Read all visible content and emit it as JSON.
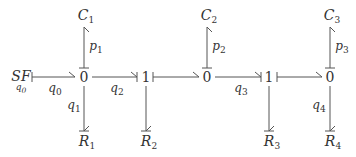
{
  "diagram": {
    "type": "bond-graph",
    "nodes": [
      {
        "id": "SF",
        "label": "SF",
        "sublabel": "q0",
        "x": 20,
        "y": 77
      },
      {
        "id": "J0a",
        "label": "0",
        "x": 84,
        "y": 77
      },
      {
        "id": "J1a",
        "label": "1",
        "x": 145,
        "y": 77
      },
      {
        "id": "J0b",
        "label": "0",
        "x": 207,
        "y": 77
      },
      {
        "id": "J1b",
        "label": "1",
        "x": 269,
        "y": 77
      },
      {
        "id": "J0c",
        "label": "0",
        "x": 330,
        "y": 77
      }
    ],
    "elements": [
      {
        "id": "C1",
        "base": "C",
        "sub": "1",
        "x": 84,
        "y": 16
      },
      {
        "id": "C2",
        "base": "C",
        "sub": "2",
        "x": 207,
        "y": 16
      },
      {
        "id": "C3",
        "base": "C",
        "sub": "3",
        "x": 330,
        "y": 16
      },
      {
        "id": "R1",
        "base": "R",
        "sub": "1",
        "x": 86,
        "y": 141
      },
      {
        "id": "R2",
        "base": "R",
        "sub": "2",
        "x": 148,
        "y": 141
      },
      {
        "id": "R3",
        "base": "R",
        "sub": "3",
        "x": 271,
        "y": 141
      },
      {
        "id": "R4",
        "base": "R",
        "sub": "4",
        "x": 332,
        "y": 141
      }
    ],
    "bonds": [
      {
        "from": "SF",
        "to": "J0a",
        "label_base": "q",
        "label_sub": "0"
      },
      {
        "from": "J0a",
        "to": "J1a",
        "label_base": "q",
        "label_sub": "2"
      },
      {
        "from": "J1a",
        "to": "J0b",
        "label_base": "",
        "label_sub": ""
      },
      {
        "from": "J0b",
        "to": "J1b",
        "label_base": "q",
        "label_sub": "3"
      },
      {
        "from": "J1b",
        "to": "J0c",
        "label_base": "",
        "label_sub": ""
      },
      {
        "from": "J0a",
        "to": "C1",
        "label_base": "p",
        "label_sub": "1"
      },
      {
        "from": "J0b",
        "to": "C2",
        "label_base": "p",
        "label_sub": "2"
      },
      {
        "from": "J0c",
        "to": "C3",
        "label_base": "p",
        "label_sub": "3"
      },
      {
        "from": "J0a",
        "to": "R1",
        "label_base": "q",
        "label_sub": "1"
      },
      {
        "from": "J1a",
        "to": "R2",
        "label_base": "",
        "label_sub": ""
      },
      {
        "from": "J1b",
        "to": "R3",
        "label_base": "",
        "label_sub": ""
      },
      {
        "from": "J0c",
        "to": "R4",
        "label_base": "q",
        "label_sub": "4"
      }
    ],
    "labels": {
      "sf": "SF",
      "sf_sub": "q",
      "sf_sub_idx": "0",
      "j0a": "0",
      "j1a": "1",
      "j0b": "0",
      "j1b": "1",
      "j0c": "0",
      "c": "C",
      "r": "R",
      "c1": "1",
      "c2": "2",
      "c3": "3",
      "r1": "1",
      "r2": "2",
      "r3": "3",
      "r4": "4",
      "q": "q",
      "p": "p",
      "q0": "0",
      "q1": "1",
      "q2": "2",
      "q3": "3",
      "q4": "4",
      "p1": "1",
      "p2": "2",
      "p3": "3"
    },
    "line_color": "#555555",
    "text_color": "#333333"
  }
}
